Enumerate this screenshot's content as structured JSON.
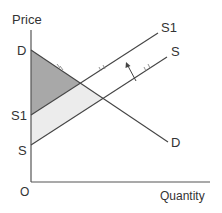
{
  "diagram": {
    "axes": {
      "y_label": "Price",
      "x_label": "Quantity",
      "origin_label": "O"
    },
    "curves": {
      "demand": {
        "label_start": "D",
        "label_end": "D"
      },
      "supply": {
        "label_start": "S",
        "label_end": "S"
      },
      "supply_shifted": {
        "label_start": "S1",
        "label_end": "S1"
      }
    },
    "regions": {
      "consumer_surplus_color": "#a8a8a8",
      "producer_surplus_color": "#ececec"
    },
    "shift_arrow": {
      "direction": "up-left",
      "meaning": "supply decreases from S to S1"
    },
    "colors": {
      "line": "#444444",
      "text": "#333333",
      "axis": "#555555"
    }
  }
}
